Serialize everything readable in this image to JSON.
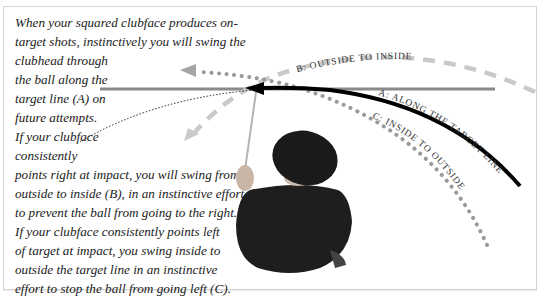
{
  "caption": {
    "lines": [
      "When your squared clubface produces on-",
      "target shots, instinctively you will swing the",
      "clubhead through",
      "the ball along the",
      "target line (A) on",
      "future attempts.",
      "If your clubface",
      "consistently",
      "points right at impact, you will swing from",
      "outside to inside (B), in an instinctive effort",
      "to prevent the ball from going to the right.",
      "If your clubface consistently points left",
      "of target at impact, you swing inside to",
      "outside the target line in an instinctive",
      "effort to stop the ball from going left (C)."
    ]
  },
  "diagram": {
    "labels": {
      "a": "A: ALONG THE TARGET LINE",
      "b": "B: OUTSIDE TO INSIDE",
      "c": "C: INSIDE TO OUTSIDE"
    },
    "colors": {
      "target_line": "#8a8a8a",
      "path_a": "#000000",
      "path_b": "#c8c8c8",
      "path_c": "#9a9a9a",
      "golfer_shirt": "#1e1e1e"
    }
  }
}
